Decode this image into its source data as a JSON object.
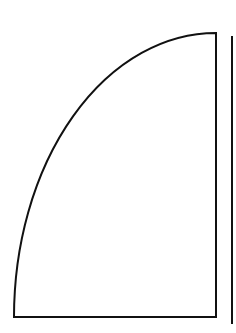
{
  "diagram": {
    "background": "#ffffff",
    "stroke_color": "#111111",
    "shapes": [
      {
        "name": "quarter-ellipse-sector",
        "corner": [
          216,
          317
        ],
        "left_end": [
          14,
          317
        ],
        "top_end": [
          216,
          33
        ],
        "rx": 202,
        "ry": 284,
        "stroke_width": 2
      },
      {
        "name": "vertical-line",
        "x": 232,
        "y1": 36,
        "y2": 324,
        "stroke_width": 2
      }
    ]
  }
}
